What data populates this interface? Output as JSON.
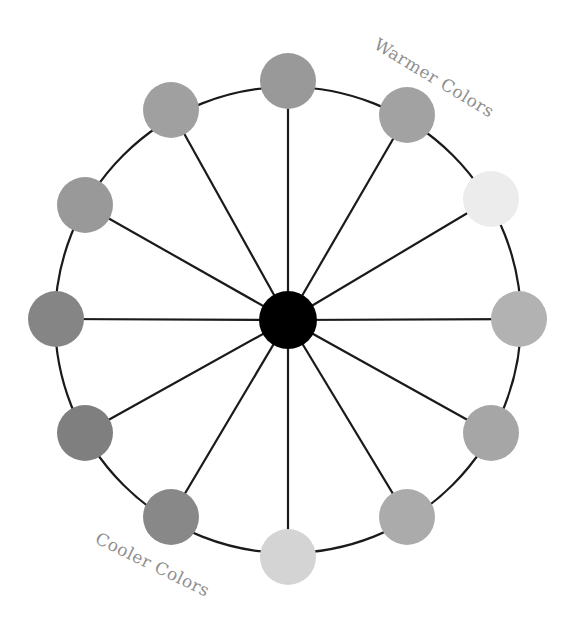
{
  "diagram": {
    "center": {
      "x": 288,
      "y": 320,
      "radius": 29,
      "color": "#000000"
    },
    "ring": {
      "radius": 233,
      "stroke": "#1a1a1a",
      "stroke_width": 2.2
    },
    "spoke": {
      "stroke": "#1a1a1a",
      "stroke_width": 2.2
    },
    "node_radius": 28,
    "nodes": [
      {
        "id": "n0",
        "x": 288,
        "y": 81,
        "color": "#999999"
      },
      {
        "id": "n1",
        "x": 407,
        "y": 115,
        "color": "#a2a2a2"
      },
      {
        "id": "n2",
        "x": 491,
        "y": 199,
        "color": "#ececec"
      },
      {
        "id": "n3",
        "x": 519,
        "y": 319,
        "color": "#b2b2b2"
      },
      {
        "id": "n4",
        "x": 491,
        "y": 433,
        "color": "#a6a6a6"
      },
      {
        "id": "n5",
        "x": 407,
        "y": 517,
        "color": "#ababab"
      },
      {
        "id": "n6",
        "x": 288,
        "y": 557,
        "color": "#d4d4d4"
      },
      {
        "id": "n7",
        "x": 171,
        "y": 517,
        "color": "#888888"
      },
      {
        "id": "n8",
        "x": 85,
        "y": 433,
        "color": "#7f7f7f"
      },
      {
        "id": "n9",
        "x": 56,
        "y": 319,
        "color": "#858585"
      },
      {
        "id": "n10",
        "x": 85,
        "y": 205,
        "color": "#999999"
      },
      {
        "id": "n11",
        "x": 171,
        "y": 110,
        "color": "#a0a0a0"
      }
    ],
    "labels": {
      "warmer": "Warmer Colors",
      "cooler": "Cooler Colors"
    }
  }
}
